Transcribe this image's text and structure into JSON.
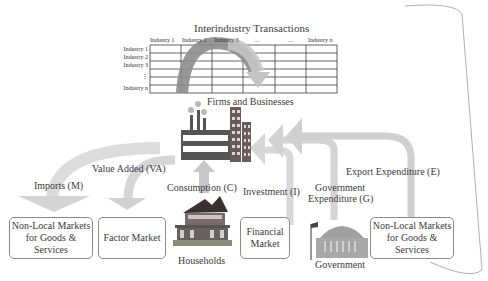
{
  "title": "Interindustry Transactions",
  "table": {
    "columns": [
      "Industry 1",
      "Industry 2",
      "Industry 3",
      "…",
      "…",
      "Industry n"
    ],
    "rows": [
      "Industry 1",
      "Industry 2",
      "Industry 3",
      "⋮",
      "Industry n"
    ]
  },
  "nodes": {
    "firms": "Firms and Businesses",
    "households": "Households",
    "government": "Government"
  },
  "boxes": {
    "nonlocal_left": "Non-Local Markets\nfor Goods &\nServices",
    "factor": "Factor Market",
    "financial": "Financial\nMarket",
    "nonlocal_right": "Non-Local Markets\nfor Goods &\nServices"
  },
  "flows": {
    "imports": "Imports (M)",
    "value_added": "Value Added (VA)",
    "consumption": "Consumption (C)",
    "investment": "Investment (I)",
    "government_line1": "Government",
    "government_line2": "Expenditure (G)",
    "export": "Export Expenditure (E)"
  },
  "colors": {
    "arrow_light": "#d6d6d6",
    "arrow_dark": "#8c8c8c",
    "building": "#555555",
    "building_accent": "#9a6b6b",
    "box_border": "#8a8a8a"
  }
}
